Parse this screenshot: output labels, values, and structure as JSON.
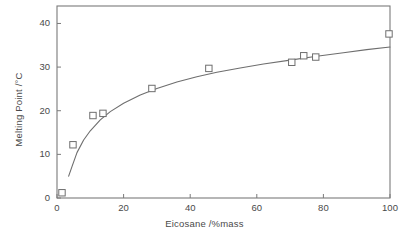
{
  "chart_data": {
    "type": "scatter",
    "title": "",
    "xlabel": "Eicosane /%mass",
    "ylabel": "Melting Point /°C",
    "xlim": [
      0,
      100
    ],
    "ylim": [
      0,
      44
    ],
    "xticks": [
      0,
      20,
      40,
      60,
      80,
      100
    ],
    "yticks": [
      0,
      10,
      20,
      30,
      40
    ],
    "xtick_labels": [
      "0",
      "20",
      "40",
      "60",
      "80",
      "100"
    ],
    "ytick_labels": [
      "0",
      "10",
      "20",
      "30",
      "40"
    ],
    "grid": false,
    "legend": null,
    "marker": "open-square",
    "series": [
      {
        "name": "measured melting point",
        "type": "scatter",
        "x": [
          1.5,
          4.8,
          10.8,
          13.8,
          28.5,
          45.6,
          70.5,
          74.1,
          77.7,
          99.7
        ],
        "y": [
          1.2,
          12.2,
          18.9,
          19.4,
          25.1,
          29.7,
          31.1,
          32.6,
          32.3,
          37.6
        ]
      },
      {
        "name": "fitted curve",
        "type": "line",
        "x": [
          3.5,
          4.5,
          6,
          8,
          10,
          13,
          16,
          20,
          25,
          30,
          36,
          42,
          48,
          55,
          62,
          70,
          78,
          86,
          93,
          100
        ],
        "y": [
          5.0,
          7.2,
          10.4,
          13.3,
          15.4,
          17.9,
          19.8,
          21.7,
          23.6,
          25.1,
          26.6,
          27.8,
          28.8,
          29.8,
          30.7,
          31.6,
          32.5,
          33.3,
          34.0,
          34.6
        ]
      }
    ],
    "colors": {
      "axis": "#7a7a7a",
      "curve": "#6e6e6e",
      "marker_stroke": "#6e6e6e",
      "marker_fill": "#ffffff",
      "text": "#4a4a4a",
      "background": "#ffffff"
    },
    "geometry": {
      "plot_left_px": 57,
      "plot_right_px": 390,
      "plot_top_px": 6,
      "plot_bottom_px": 198
    }
  }
}
